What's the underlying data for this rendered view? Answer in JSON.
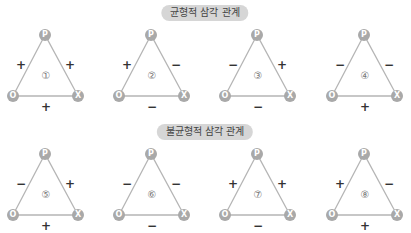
{
  "sections": [
    {
      "title": "균형적 삼각 관계",
      "triangles": [
        {
          "num": "①",
          "op": "+",
          "px": "+",
          "ox": "+"
        },
        {
          "num": "②",
          "op": "+",
          "px": "−",
          "ox": "−"
        },
        {
          "num": "③",
          "op": "−",
          "px": "+",
          "ox": "−"
        },
        {
          "num": "④",
          "op": "−",
          "px": "−",
          "ox": "+"
        }
      ]
    },
    {
      "title": "불균형적 삼각 관계",
      "triangles": [
        {
          "num": "⑤",
          "op": "−",
          "px": "+",
          "ox": "+"
        },
        {
          "num": "⑥",
          "op": "−",
          "px": "−",
          "ox": "−"
        },
        {
          "num": "⑦",
          "op": "+",
          "px": "+",
          "ox": "−"
        },
        {
          "num": "⑧",
          "op": "+",
          "px": "−",
          "ox": "+"
        }
      ]
    }
  ],
  "nodes": {
    "p": "P",
    "o": "O",
    "x": "X"
  },
  "colors": {
    "line": "#b5b5b5",
    "node": "#a9a9a9",
    "pill": "#d6d6d6"
  }
}
